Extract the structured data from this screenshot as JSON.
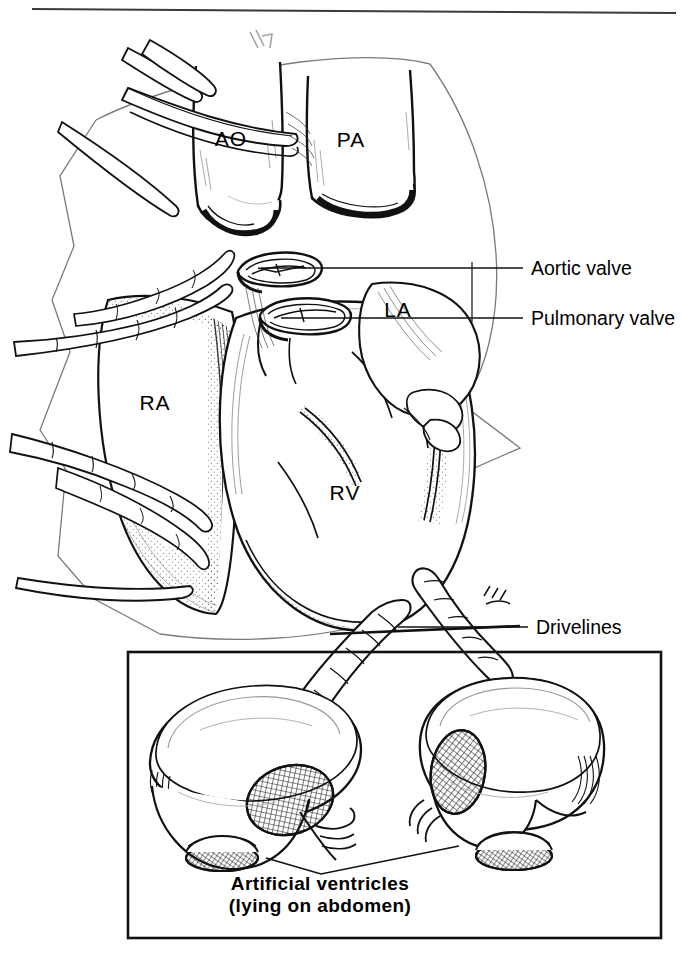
{
  "figure": {
    "kind": "medical-line-illustration",
    "background_color": "#ffffff",
    "ink_color": "#000000",
    "top_rule": true
  },
  "chamber_labels": [
    {
      "id": "ao",
      "text": "AO",
      "x": 231,
      "y": 146,
      "anchor": "middle"
    },
    {
      "id": "pa",
      "text": "PA",
      "x": 351,
      "y": 147,
      "anchor": "middle"
    },
    {
      "id": "la",
      "text": "LA",
      "x": 398,
      "y": 317,
      "anchor": "middle"
    },
    {
      "id": "ra",
      "text": "RA",
      "x": 155,
      "y": 410,
      "anchor": "middle"
    },
    {
      "id": "rv",
      "text": "RV",
      "x": 345,
      "y": 500,
      "anchor": "middle"
    }
  ],
  "callouts": [
    {
      "id": "aortic-valve",
      "text": "Aortic valve",
      "text_x": 531,
      "text_y": 275,
      "leader": {
        "x1": 261,
        "y1": 268,
        "x2": 523,
        "y2": 268
      }
    },
    {
      "id": "pulmonary-valve",
      "text": "Pulmonary valve",
      "text_x": 531,
      "text_y": 325,
      "leader": {
        "x1": 281,
        "y1": 318,
        "x2": 523,
        "y2": 318
      }
    },
    {
      "id": "drivelines",
      "text": "Drivelines",
      "text_x": 536,
      "text_y": 634,
      "leader": {
        "x1": 398,
        "y1": 627,
        "x2": 528,
        "y2": 627
      }
    }
  ],
  "inset": {
    "box": {
      "x": 128,
      "y": 652,
      "width": 533,
      "height": 286
    },
    "caption_lines": [
      {
        "id": "caption-line-1",
        "text": "Artificial  ventricles",
        "x": 320,
        "y": 890
      },
      {
        "id": "caption-line-2",
        "text": "(lying on abdomen)",
        "x": 320,
        "y": 912
      }
    ],
    "ventricles": [
      {
        "id": "left-artificial-ventricle",
        "side": "left"
      },
      {
        "id": "right-artificial-ventricle",
        "side": "right"
      }
    ],
    "caption_leader": {
      "left": {
        "x1": 266,
        "y1": 858,
        "x2": 321,
        "y2": 872
      },
      "right": {
        "x1": 459,
        "y1": 846,
        "x2": 321,
        "y2": 872
      }
    }
  }
}
